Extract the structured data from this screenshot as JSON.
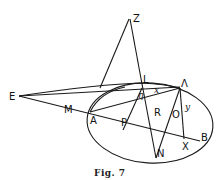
{
  "figure": {
    "caption": "Fig. 7",
    "points": {
      "Z": "Z",
      "L": "L",
      "E": "E",
      "M": "M",
      "A": "A",
      "P": "P",
      "R": "R",
      "Lambda": "Λ",
      "O": "O",
      "B": "B",
      "X": "X",
      "N": "N"
    },
    "angle_labels": {
      "x": "x",
      "y": "y",
      "eta": "η"
    },
    "colors": {
      "stroke": "#1a1a1a",
      "background": "#ffffff"
    }
  }
}
